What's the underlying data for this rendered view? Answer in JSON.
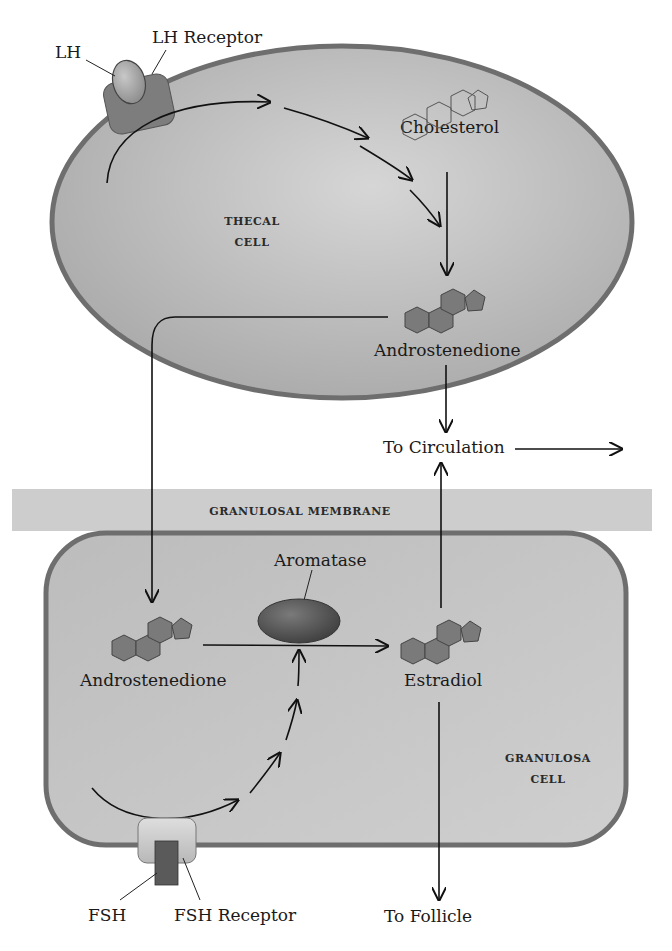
{
  "diagram": {
    "labels": {
      "lh": "LH",
      "lh_receptor": "LH Receptor",
      "cholesterol": "Cholesterol",
      "thecal_cell_line1": "THECAL",
      "thecal_cell_line2": "CELL",
      "androstenedione_thecal": "Androstenedione",
      "to_circulation": "To Circulation",
      "granulosal_membrane": "GRANULOSAL MEMBRANE",
      "aromatase": "Aromatase",
      "androstenedione_granulosa": "Androstenedione",
      "estradiol": "Estradiol",
      "granulosa_cell_line1": "GRANULOSA",
      "granulosa_cell_line2": "CELL",
      "fsh": "FSH",
      "fsh_receptor": "FSH Receptor",
      "to_follicle": "To Follicle"
    },
    "colors": {
      "cell_fill": "#bdbdbd",
      "cell_border": "#6e6e6e",
      "membrane_band": "#cfcfcf",
      "molecule_dark": "#7a7a7a",
      "receptor": "#8a8a8a",
      "aromatase": "#555555",
      "fsh": "#5a5a5a"
    }
  }
}
